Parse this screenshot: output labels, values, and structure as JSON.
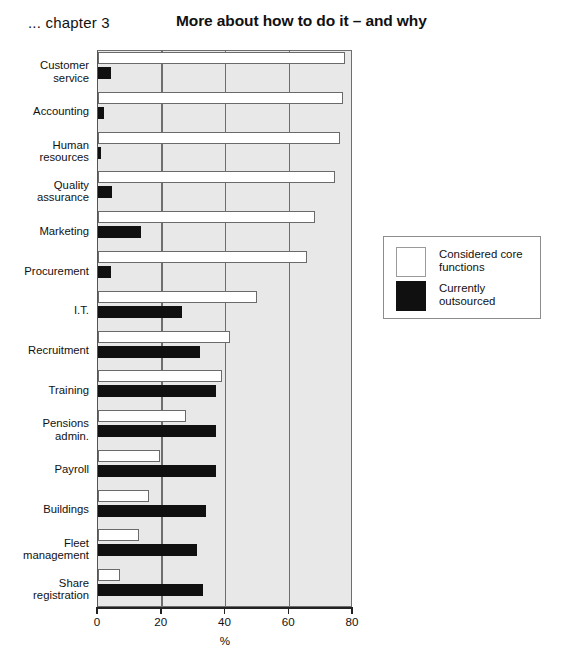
{
  "header": {
    "chapter_label": "... chapter 3",
    "title": "More about how to do it – and why"
  },
  "legend": {
    "entries": [
      {
        "label": "Considered core\nfunctions",
        "swatch": "white-square-icon",
        "color": "#ffffff"
      },
      {
        "label": "Currently outsourced",
        "swatch": "black-square-icon",
        "color": "#101010"
      }
    ]
  },
  "chart_data": {
    "type": "bar",
    "orientation": "horizontal",
    "title": "More about how to do it – and why",
    "xlabel": "%",
    "ylabel": "",
    "xlim": [
      0,
      80
    ],
    "xticks": [
      0,
      20,
      40,
      60,
      80
    ],
    "grid": true,
    "legend_position": "right",
    "categories": [
      "Customer service",
      "Accounting",
      "Human resources",
      "Quality assurance",
      "Marketing",
      "Procurement",
      "I.T.",
      "Recruitment",
      "Training",
      "Pensions admin.",
      "Payroll",
      "Buildings",
      "Fleet management",
      "Share registration"
    ],
    "category_labels": [
      "Customer\nservice",
      "Accounting",
      "Human\nresources",
      "Quality\nassurance",
      "Marketing",
      "Procurement",
      "I.T.",
      "Recruitment",
      "Training",
      "Pensions\nadmin.",
      "Payroll",
      "Buildings",
      "Fleet\nmanagement",
      "Share\nregistration"
    ],
    "series": [
      {
        "name": "Considered core functions",
        "color": "#ffffff",
        "values": [
          77.5,
          77,
          76,
          74.5,
          68,
          65.5,
          50,
          41.5,
          39,
          27.5,
          19.5,
          16,
          13,
          7
        ]
      },
      {
        "name": "Currently outsourced",
        "color": "#101010",
        "values": [
          4,
          2,
          1,
          4.5,
          13.5,
          4,
          26.5,
          32,
          37,
          37,
          37,
          34,
          31,
          33
        ]
      }
    ]
  }
}
